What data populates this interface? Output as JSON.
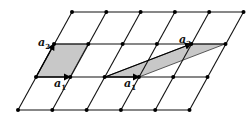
{
  "diagram": {
    "grid": {
      "rows_y": [
        12,
        44,
        77,
        110
      ],
      "row_x0": [
        72,
        54,
        36,
        18
      ],
      "col_step": 34.3,
      "cols": 6,
      "line_color": "#111111",
      "point_color": "#000000"
    },
    "cells": [
      {
        "name": "primitive-square-cell",
        "points": "36,77 70,77 88,44 54,44",
        "fill": "#c8c8c8"
      },
      {
        "name": "skewed-primitive-cell",
        "points": "105,77 139,77 225,44 191,44",
        "fill": "#c8c8c8"
      }
    ],
    "vectors": [
      {
        "name": "a1-left",
        "x1": 36,
        "y1": 77,
        "x2": 70,
        "y2": 77
      },
      {
        "name": "a2-left",
        "x1": 36,
        "y1": 77,
        "x2": 54,
        "y2": 44
      },
      {
        "name": "a1-right",
        "x1": 105,
        "y1": 77,
        "x2": 139,
        "y2": 77
      },
      {
        "name": "a2-right",
        "x1": 105,
        "y1": 77,
        "x2": 191,
        "y2": 44
      }
    ],
    "labels": [
      {
        "name": "label-a2-left",
        "text": "a",
        "sub": "2",
        "x": 38,
        "y": 37
      },
      {
        "name": "label-a1-left",
        "text": "a",
        "sub": "1",
        "x": 54,
        "y": 78
      },
      {
        "name": "label-a1-right",
        "text": "a",
        "sub": "1",
        "x": 124,
        "y": 78
      },
      {
        "name": "label-a2-right",
        "text": "a",
        "sub": "2",
        "x": 179,
        "y": 34
      }
    ]
  }
}
